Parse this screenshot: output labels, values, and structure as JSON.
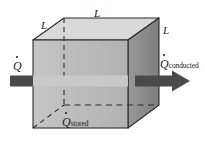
{
  "figure": {
    "background_color": "#ffffff"
  },
  "cube": {
    "front_face_color": "#b8b8b8",
    "top_face_color": "#d8d8d8",
    "right_face_color": "#8a8a8a",
    "edge_color": "#2b2b2b",
    "hidden_edge_style": "dashed",
    "front": {
      "left": 33,
      "right": 128,
      "top": 40,
      "bottom": 128
    },
    "depth_offset": {
      "dx": 31,
      "dy": -22
    }
  },
  "arrow": {
    "color": "#4a4a4a",
    "band_color": "#c9c9c9",
    "y_center": 81,
    "thickness": 11,
    "tail_start_x": 10,
    "head_tip_x": 190,
    "head_width": 17,
    "head_height": 21,
    "direction": "right"
  },
  "dimension_labels": [
    {
      "id": "L-left",
      "text": "L"
    },
    {
      "id": "L-top",
      "text": "L"
    },
    {
      "id": "L-right",
      "text": "L"
    }
  ],
  "heat_labels": {
    "input": {
      "symbol": "Q",
      "dot": true,
      "subscript": ""
    },
    "conducted": {
      "symbol": "Q",
      "dot": true,
      "subscript": "conducted"
    },
    "stored": {
      "symbol": "Q",
      "dot": true,
      "subscript": "stored"
    }
  }
}
